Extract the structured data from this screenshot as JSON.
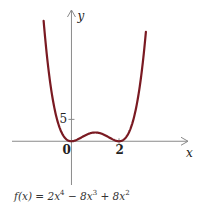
{
  "chart_data": {
    "type": "line",
    "function": "f(x) = 2x^4 - 8x^3 + 8x^2",
    "coefficients": {
      "x4": 2,
      "x3": -8,
      "x2": 8,
      "x1": 0,
      "x0": 0
    },
    "series": [
      {
        "name": "f(x)",
        "color": "#7a1a22",
        "x_range": [
          -1.17,
          3.13
        ]
      }
    ],
    "key_points": [
      {
        "x": 0,
        "y": 0,
        "label": "local minimum"
      },
      {
        "x": 1,
        "y": 2,
        "label": "local maximum"
      },
      {
        "x": 2,
        "y": 0,
        "label": "local minimum"
      }
    ],
    "xlabel": "x",
    "ylabel": "y",
    "x_ticks": [
      {
        "value": 0,
        "label": "0"
      },
      {
        "value": 2,
        "label": "2"
      }
    ],
    "y_ticks": [
      {
        "value": 5,
        "label": "5"
      }
    ],
    "xlim": [
      -2.5,
      4.9
    ],
    "ylim": [
      -10,
      30
    ],
    "grid": false,
    "title": ""
  },
  "caption": {
    "prefix": "f(x) = 2x",
    "exp1": "4",
    "mid1": " − 8x",
    "exp2": "3",
    "mid2": " + 8x",
    "exp3": "2"
  }
}
